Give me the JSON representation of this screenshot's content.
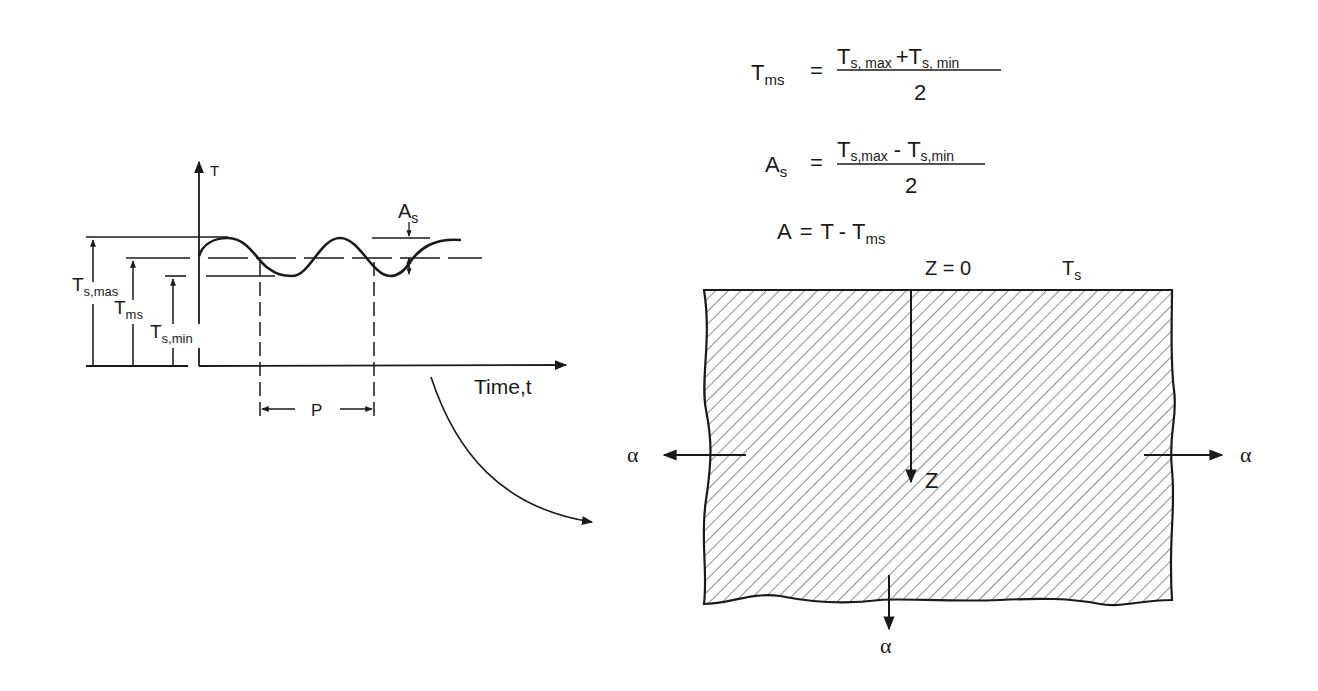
{
  "formulas": {
    "tms": {
      "lhs": "T",
      "lhs_sub": "ms",
      "eq": "=",
      "num_a": "T",
      "num_a_sub": "s, max",
      "op": "+",
      "num_b": "T",
      "num_b_sub": "s, min",
      "den": "2"
    },
    "as": {
      "lhs": "A",
      "lhs_sub": "s",
      "eq": "=",
      "num_a": "T",
      "num_a_sub": "s,max",
      "op": "-",
      "num_b": "T",
      "num_b_sub": "s,min",
      "den": "2"
    },
    "a": {
      "lhs": "A",
      "eq": "=",
      "rhs_a": "T",
      "op": "-",
      "rhs_b": "T",
      "rhs_b_sub": "ms"
    }
  },
  "graph": {
    "y_axis_label": "T",
    "x_axis_label": "Time,t",
    "amplitude_label": "A",
    "amplitude_sub": "s",
    "period_label": "P",
    "level_labels": [
      {
        "main": "T",
        "sub": "s,mas"
      },
      {
        "main": "T",
        "sub": "ms"
      },
      {
        "main": "T",
        "sub": "s,min"
      }
    ]
  },
  "slab": {
    "surface_label": "Z = 0",
    "surface_temp": "T",
    "surface_temp_sub": "s",
    "depth_label": "Z",
    "alpha_left": "α",
    "alpha_right": "α",
    "alpha_bottom": "α"
  }
}
